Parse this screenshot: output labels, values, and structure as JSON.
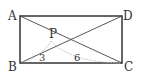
{
  "figure": {
    "type": "geometry",
    "shape": "rectangle",
    "points": {
      "A": {
        "label": "A",
        "x": 20,
        "y": 16
      },
      "B": {
        "label": "B",
        "x": 20,
        "y": 63
      },
      "C": {
        "label": "C",
        "x": 122,
        "y": 63
      },
      "D": {
        "label": "D",
        "x": 122,
        "y": 16
      },
      "P": {
        "label": "P",
        "x": 51,
        "y": 41
      }
    },
    "segments": [
      "AB",
      "BC",
      "CD",
      "DA",
      "AC",
      "DB"
    ],
    "dimension_labels": {
      "PB": "3",
      "PC": "6"
    },
    "colors": {
      "stroke": "#333333",
      "dimension": "#bbbbbb",
      "background": "#ffffff"
    }
  }
}
